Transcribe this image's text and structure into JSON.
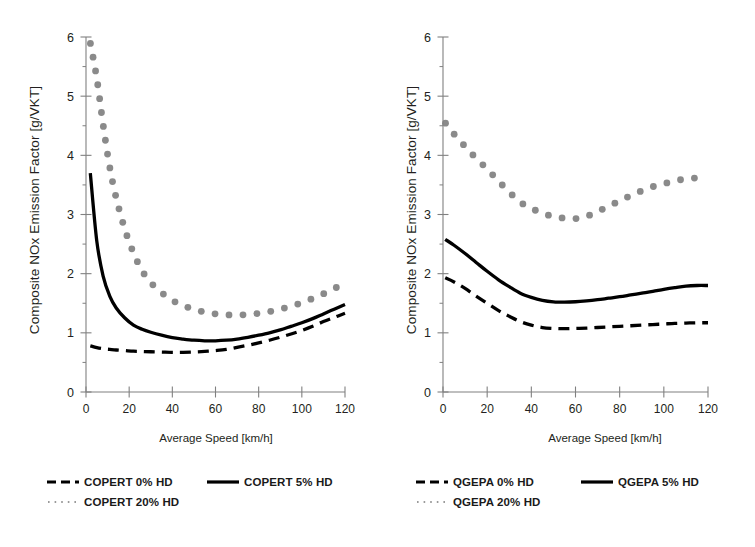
{
  "figure": {
    "panels": [
      {
        "id": "copert",
        "name": "left-panel",
        "axis": {
          "xlabel": "Average Speed [km/h]",
          "ylabel": "Composite NOx Emission Factor [g/VKT]",
          "xticks": [
            "0",
            "20",
            "40",
            "60",
            "80",
            "100",
            "120"
          ],
          "yticks": [
            "0",
            "1",
            "2",
            "3",
            "4",
            "5",
            "6"
          ]
        },
        "legend": [
          {
            "label": "COPERT 0% HD",
            "style": "dashed"
          },
          {
            "label": "COPERT 5% HD",
            "style": "solid"
          },
          {
            "label": "COPERT 20% HD",
            "style": "dotted"
          }
        ]
      },
      {
        "id": "qgepa",
        "name": "right-panel",
        "axis": {
          "xlabel": "Average Speed [km/h]",
          "ylabel": "Composite NOx Emission Factor [g/VKT]",
          "xticks": [
            "0",
            "20",
            "40",
            "60",
            "80",
            "100",
            "120"
          ],
          "yticks": [
            "0",
            "1",
            "2",
            "3",
            "4",
            "5",
            "6"
          ]
        },
        "legend": [
          {
            "label": "QGEPA 0% HD",
            "style": "dashed"
          },
          {
            "label": "QGEPA 5% HD",
            "style": "solid"
          },
          {
            "label": "QGEPA 20% HD",
            "style": "dotted"
          }
        ]
      }
    ]
  },
  "colors": {
    "line": "#000000",
    "dotted_marker": "#808080",
    "axis": "#808080",
    "text": "#231f20",
    "background": "#ffffff"
  },
  "chart_data": [
    {
      "type": "line",
      "id": "copert",
      "title": "",
      "xlabel": "Average Speed [km/h]",
      "ylabel": "Composite NOx Emission Factor [g/VKT]",
      "xlim": [
        0,
        120
      ],
      "ylim": [
        0,
        6
      ],
      "xticks": [
        0,
        20,
        40,
        60,
        80,
        100,
        120
      ],
      "yticks": [
        0,
        1,
        2,
        3,
        4,
        5,
        6
      ],
      "grid": false,
      "legend_position": "below",
      "x": [
        2,
        5,
        8,
        11,
        14,
        18,
        22,
        26,
        30,
        35,
        40,
        45,
        50,
        55,
        60,
        65,
        70,
        75,
        80,
        85,
        90,
        95,
        100,
        105,
        110,
        115,
        120
      ],
      "series": [
        {
          "name": "COPERT 0% HD",
          "style": "dashed",
          "values": [
            0.78,
            0.75,
            0.73,
            0.72,
            0.71,
            0.7,
            0.69,
            0.685,
            0.68,
            0.675,
            0.67,
            0.67,
            0.675,
            0.685,
            0.7,
            0.72,
            0.755,
            0.79,
            0.83,
            0.875,
            0.925,
            0.98,
            1.04,
            1.11,
            1.19,
            1.26,
            1.33
          ]
        },
        {
          "name": "COPERT 5% HD",
          "style": "solid",
          "values": [
            3.7,
            2.55,
            1.95,
            1.62,
            1.42,
            1.25,
            1.13,
            1.06,
            1.01,
            0.96,
            0.92,
            0.895,
            0.875,
            0.865,
            0.865,
            0.875,
            0.895,
            0.925,
            0.96,
            1.0,
            1.05,
            1.11,
            1.17,
            1.24,
            1.32,
            1.4,
            1.48
          ]
        },
        {
          "name": "COPERT 20% HD",
          "style": "dotted",
          "values": [
            5.9,
            5.3,
            4.5,
            3.8,
            3.28,
            2.75,
            2.35,
            2.05,
            1.85,
            1.68,
            1.55,
            1.46,
            1.4,
            1.35,
            1.32,
            1.305,
            1.3,
            1.31,
            1.33,
            1.36,
            1.4,
            1.45,
            1.51,
            1.58,
            1.66,
            1.75,
            1.83
          ]
        }
      ]
    },
    {
      "type": "line",
      "id": "qgepa",
      "title": "",
      "xlabel": "Average Speed [km/h]",
      "ylabel": "Composite NOx Emission Factor [g/VKT]",
      "xlim": [
        0,
        120
      ],
      "ylim": [
        0,
        6
      ],
      "xticks": [
        0,
        20,
        40,
        60,
        80,
        100,
        120
      ],
      "yticks": [
        0,
        1,
        2,
        3,
        4,
        5,
        6
      ],
      "grid": false,
      "legend_position": "below",
      "x": [
        1,
        5,
        10,
        15,
        20,
        25,
        30,
        35,
        40,
        45,
        50,
        55,
        60,
        65,
        70,
        75,
        80,
        85,
        90,
        95,
        100,
        105,
        110,
        115,
        120
      ],
      "series": [
        {
          "name": "QGEPA 0% HD",
          "style": "dashed",
          "values": [
            1.93,
            1.86,
            1.75,
            1.62,
            1.5,
            1.38,
            1.28,
            1.19,
            1.13,
            1.09,
            1.075,
            1.07,
            1.075,
            1.08,
            1.09,
            1.1,
            1.11,
            1.12,
            1.13,
            1.14,
            1.15,
            1.16,
            1.165,
            1.17,
            1.17
          ]
        },
        {
          "name": "QGEPA 5% HD",
          "style": "solid",
          "values": [
            2.58,
            2.48,
            2.34,
            2.19,
            2.04,
            1.9,
            1.78,
            1.67,
            1.6,
            1.55,
            1.525,
            1.52,
            1.525,
            1.54,
            1.56,
            1.585,
            1.61,
            1.64,
            1.67,
            1.7,
            1.735,
            1.765,
            1.79,
            1.8,
            1.8
          ]
        },
        {
          "name": "QGEPA 20% HD",
          "style": "dotted",
          "values": [
            4.55,
            4.36,
            4.15,
            3.95,
            3.77,
            3.57,
            3.38,
            3.21,
            3.1,
            3.03,
            2.96,
            2.94,
            2.93,
            2.97,
            3.05,
            3.14,
            3.23,
            3.32,
            3.4,
            3.47,
            3.52,
            3.57,
            3.6,
            3.62,
            3.63
          ]
        }
      ]
    }
  ]
}
